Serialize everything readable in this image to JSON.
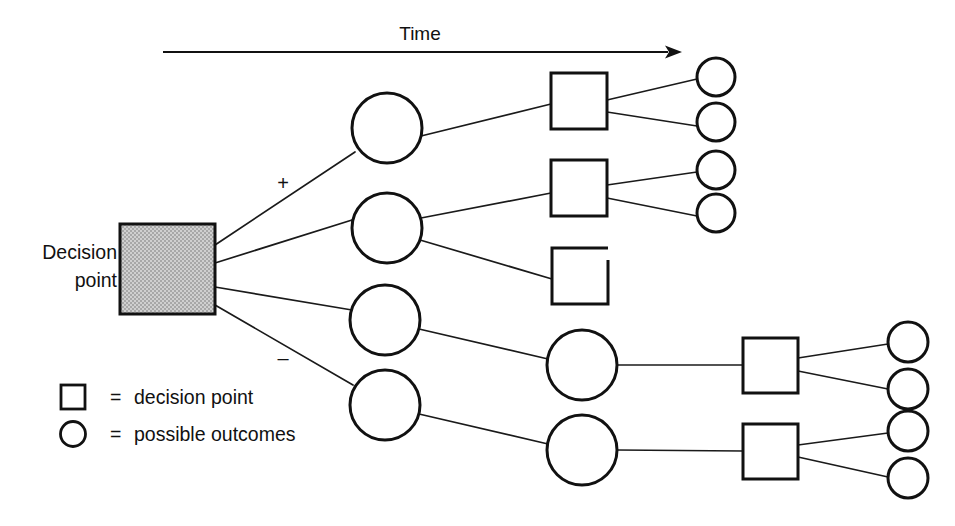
{
  "figure": {
    "type": "decision-tree-diagram",
    "title": "",
    "background_color": "#ffffff",
    "line_color": "#111111",
    "root_fill_color": "#c9c9c9",
    "width": 955,
    "height": 526
  },
  "axis": {
    "label": "Time",
    "label_x": 420,
    "label_y": 40,
    "arrow_start_x": 163,
    "arrow_end_x": 682,
    "arrow_y": 52,
    "arrow_icon": "right-arrow-icon"
  },
  "root": {
    "label_line1": "Decision",
    "label_line2": "point",
    "label_x": 117,
    "label_y1": 259,
    "label_y2": 287,
    "box": {
      "x": 120,
      "y": 224,
      "w": 95,
      "h": 90
    }
  },
  "branch_signs": [
    {
      "name": "plus",
      "text": "+",
      "x": 283,
      "y": 190
    },
    {
      "name": "minus",
      "text": "–",
      "x": 283,
      "y": 365
    }
  ],
  "legend": {
    "items": [
      {
        "symbol": "square",
        "symbol_name": "square-symbol",
        "equals": "=",
        "label": "decision point",
        "y": 404
      },
      {
        "symbol": "circle",
        "symbol_name": "circle-symbol",
        "equals": "=",
        "label": "possible outcomes",
        "y": 441
      }
    ],
    "symbol_x": 73,
    "equals_x": 110,
    "label_x": 134
  },
  "nodes": {
    "level1_circles": [
      {
        "id": "c1",
        "cx": 387,
        "cy": 128,
        "r": 35
      },
      {
        "id": "c2",
        "cx": 387,
        "cy": 228,
        "r": 35
      },
      {
        "id": "c3",
        "cx": 385,
        "cy": 320,
        "r": 35
      },
      {
        "id": "c4",
        "cx": 385,
        "cy": 405,
        "r": 35
      }
    ],
    "level2_squares_top": [
      {
        "id": "s1",
        "x": 551,
        "y": 73,
        "w": 56,
        "h": 56,
        "open": false
      },
      {
        "id": "s2",
        "x": 551,
        "y": 160,
        "w": 56,
        "h": 56,
        "open": false
      },
      {
        "id": "s3",
        "x": 552,
        "y": 248,
        "w": 56,
        "h": 56,
        "open": true
      }
    ],
    "level2_circles_bottom": [
      {
        "id": "b1",
        "cx": 582,
        "cy": 365,
        "r": 35
      },
      {
        "id": "b2",
        "cx": 582,
        "cy": 450,
        "r": 35
      }
    ],
    "level3_squares_bottom": [
      {
        "id": "s4",
        "x": 743,
        "y": 338,
        "w": 55,
        "h": 55,
        "open": false
      },
      {
        "id": "s5",
        "x": 743,
        "y": 424,
        "w": 55,
        "h": 55,
        "open": false
      }
    ],
    "outcome_circles_top": [
      {
        "id": "o1",
        "cx": 716,
        "cy": 77,
        "r": 19
      },
      {
        "id": "o2",
        "cx": 716,
        "cy": 122,
        "r": 19
      },
      {
        "id": "o3",
        "cx": 716,
        "cy": 170,
        "r": 19
      },
      {
        "id": "o4",
        "cx": 716,
        "cy": 213,
        "r": 19
      }
    ],
    "outcome_circles_bottom": [
      {
        "id": "o5",
        "cx": 908,
        "cy": 342,
        "r": 20
      },
      {
        "id": "o6",
        "cx": 908,
        "cy": 389,
        "r": 20
      },
      {
        "id": "o7",
        "cx": 908,
        "cy": 431,
        "r": 20
      },
      {
        "id": "o8",
        "cx": 908,
        "cy": 478,
        "r": 20
      }
    ]
  },
  "edges": [
    {
      "from": "root",
      "to": "c1",
      "x1": 215,
      "y1": 245,
      "x2": 355,
      "y2": 152
    },
    {
      "from": "root",
      "to": "c2",
      "x1": 215,
      "y1": 263,
      "x2": 352,
      "y2": 220
    },
    {
      "from": "root",
      "to": "c3",
      "x1": 215,
      "y1": 287,
      "x2": 352,
      "y2": 310
    },
    {
      "from": "root",
      "to": "c4",
      "x1": 215,
      "y1": 305,
      "x2": 353,
      "y2": 385
    },
    {
      "from": "c1",
      "to": "s1",
      "x1": 421,
      "y1": 136,
      "x2": 551,
      "y2": 104
    },
    {
      "from": "c2",
      "to": "s2",
      "x1": 421,
      "y1": 218,
      "x2": 551,
      "y2": 193
    },
    {
      "from": "c2",
      "to": "s3",
      "x1": 420,
      "y1": 240,
      "x2": 552,
      "y2": 279
    },
    {
      "from": "c3",
      "to": "b1",
      "x1": 419,
      "y1": 329,
      "x2": 548,
      "y2": 359
    },
    {
      "from": "c4",
      "to": "b2",
      "x1": 419,
      "y1": 414,
      "x2": 548,
      "y2": 444
    },
    {
      "from": "s1",
      "to": "o1",
      "x1": 607,
      "y1": 100,
      "x2": 697,
      "y2": 79
    },
    {
      "from": "s1",
      "to": "o2",
      "x1": 607,
      "y1": 112,
      "x2": 697,
      "y2": 126
    },
    {
      "from": "s2",
      "to": "o3",
      "x1": 607,
      "y1": 185,
      "x2": 697,
      "y2": 172
    },
    {
      "from": "s2",
      "to": "o4",
      "x1": 607,
      "y1": 198,
      "x2": 697,
      "y2": 216
    },
    {
      "from": "b1",
      "to": "s4",
      "x1": 617,
      "y1": 365,
      "x2": 743,
      "y2": 365
    },
    {
      "from": "b2",
      "to": "s5",
      "x1": 617,
      "y1": 450,
      "x2": 743,
      "y2": 451
    },
    {
      "from": "s4",
      "to": "o5",
      "x1": 798,
      "y1": 358,
      "x2": 888,
      "y2": 344
    },
    {
      "from": "s4",
      "to": "o6",
      "x1": 798,
      "y1": 371,
      "x2": 888,
      "y2": 389
    },
    {
      "from": "s5",
      "to": "o7",
      "x1": 798,
      "y1": 445,
      "x2": 888,
      "y2": 433
    },
    {
      "from": "s5",
      "to": "o8",
      "x1": 798,
      "y1": 457,
      "x2": 888,
      "y2": 477
    }
  ]
}
